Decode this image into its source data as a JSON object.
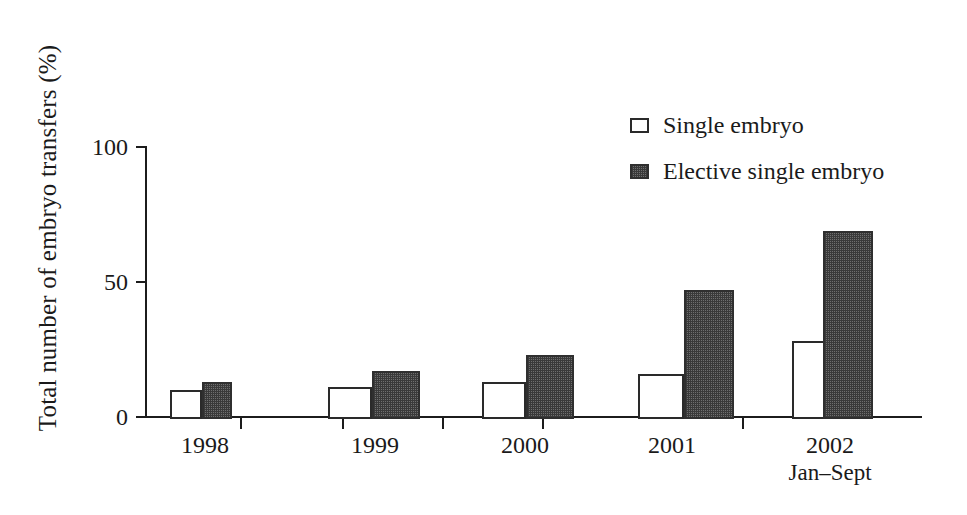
{
  "chart_data": {
    "type": "bar",
    "title": "",
    "xlabel": "",
    "ylabel": "Total number of embryo transfers (%)",
    "ylim": [
      0,
      100
    ],
    "yticks": [
      0,
      50,
      100
    ],
    "ytick_labels": [
      "0",
      "50",
      "100"
    ],
    "grid": false,
    "legend_position": "top-right",
    "categories": [
      "1998",
      "1999",
      "2000",
      "2001",
      "2002"
    ],
    "category_sublabels": [
      "",
      "",
      "",
      "",
      "Jan–Sept"
    ],
    "series": [
      {
        "name": "Single embryo",
        "fill": "white",
        "values": [
          10,
          11,
          13,
          16,
          28
        ]
      },
      {
        "name": "Elective single embryo",
        "fill": "dark-dotted",
        "values": [
          13,
          17,
          23,
          47,
          69
        ]
      }
    ]
  },
  "legend": {
    "items": [
      {
        "label": "Single embryo",
        "swatch": "light"
      },
      {
        "label": "Elective single embryo",
        "swatch": "dark"
      }
    ]
  },
  "colors": {
    "axis": "#1c1c1c",
    "text": "#1a1a1a",
    "bar_light_fill": "#ffffff",
    "bar_light_stroke": "#2a2a2a",
    "bar_dark_fill": "#4a4a4a",
    "bar_dark_stroke": "#2f2f2f",
    "background": "#ffffff"
  }
}
